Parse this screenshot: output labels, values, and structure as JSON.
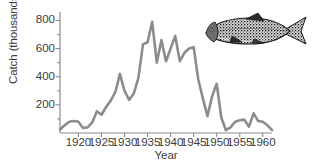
{
  "chart_data": {
    "type": "line",
    "title": "",
    "xlabel": "Year",
    "ylabel": "Catch (thousands of tons)",
    "xlim": [
      1916,
      1962
    ],
    "ylim": [
      0,
      860
    ],
    "yticks": [
      200,
      400,
      600,
      800
    ],
    "yticks_minor": [
      100,
      300,
      500,
      700
    ],
    "xticks": [
      1920,
      1925,
      1930,
      1935,
      1940,
      1945,
      1950,
      1955,
      1960
    ],
    "grid": false,
    "legend": "none",
    "line_color": "#8c8c8c",
    "axis_color": "#8c8c8c",
    "text_color": "#3c3c3c",
    "annotation_icon": "sardine-fish-illustration",
    "series": [
      {
        "name": "Pacific sardine catch",
        "x": [
          1916,
          1917,
          1918,
          1919,
          1920,
          1921,
          1922,
          1923,
          1924,
          1925,
          1926,
          1927,
          1928,
          1929,
          1930,
          1931,
          1932,
          1933,
          1934,
          1935,
          1936,
          1937,
          1938,
          1939,
          1940,
          1941,
          1942,
          1943,
          1944,
          1945,
          1946,
          1947,
          1948,
          1949,
          1950,
          1951,
          1952,
          1953,
          1954,
          1955,
          1956,
          1957,
          1958,
          1959,
          1960,
          1961,
          1962
        ],
        "values": [
          25,
          55,
          80,
          85,
          80,
          35,
          40,
          75,
          155,
          130,
          185,
          230,
          290,
          420,
          300,
          235,
          280,
          390,
          630,
          645,
          790,
          500,
          660,
          510,
          600,
          690,
          510,
          570,
          600,
          610,
          380,
          245,
          120,
          260,
          350,
          110,
          20,
          40,
          80,
          90,
          95,
          45,
          140,
          85,
          80,
          55,
          20
        ]
      }
    ]
  },
  "axis": {
    "ylabel_text": "Catch (thousands of tons)",
    "xlabel_text": "Year",
    "ytick_labels": [
      "200",
      "400",
      "600",
      "800"
    ],
    "xtick_labels": [
      "1920",
      "1925",
      "1930",
      "1935",
      "1940",
      "1945",
      "1950",
      "1955",
      "1960"
    ]
  }
}
